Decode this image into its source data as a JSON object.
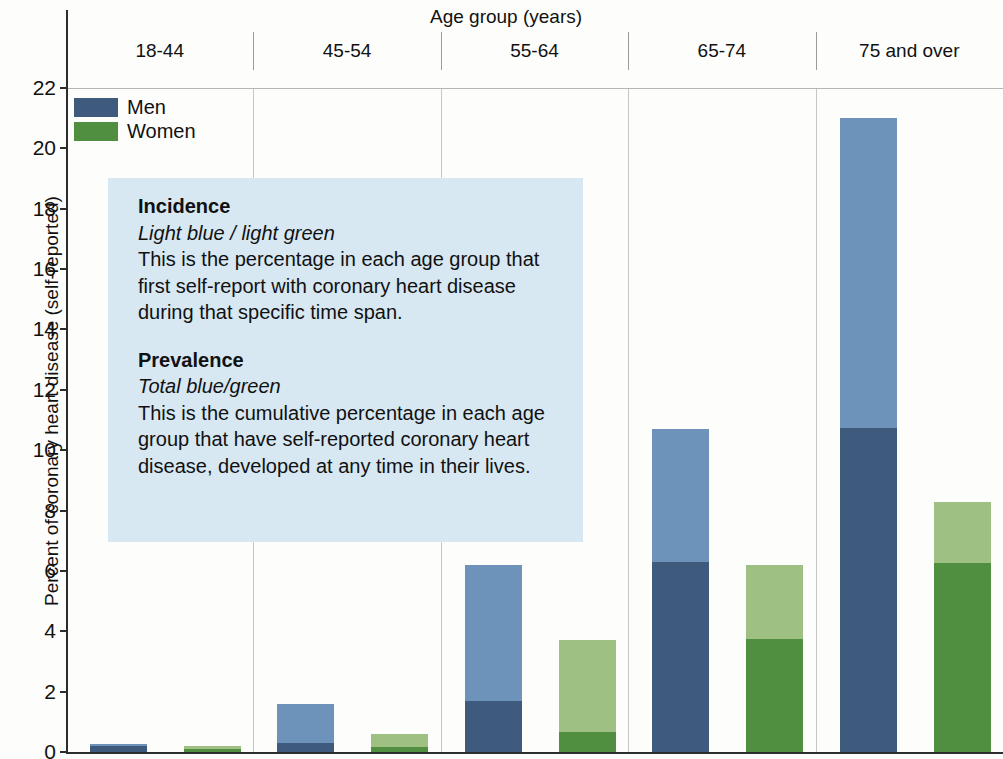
{
  "axes": {
    "x_title": "Age group (years)",
    "y_title": "Percent of coronary heart disease (self-reported)",
    "y_ticks": [
      "22",
      "20",
      "18",
      "16",
      "14",
      "12",
      "10",
      "8",
      "6",
      "4",
      "2",
      "0"
    ]
  },
  "legend": {
    "items": [
      {
        "label": "Men",
        "color": "#3e5b7d"
      },
      {
        "label": "Women",
        "color": "#4f8f3f"
      }
    ]
  },
  "infobox": {
    "incidence_head": "Incidence",
    "incidence_sub": "Light blue / light green",
    "incidence_body": "This is the percentage in each age group that first self-report with coronary heart disease during that specific time span.",
    "prevalence_head": "Prevalence",
    "prevalence_sub": "Total blue/green",
    "prevalence_body": "This is the cumulative percentage in each age group that have self-reported coronary heart disease, developed at any time in their lives.",
    "bg_color": "#d7e8f3"
  },
  "chart_data": {
    "type": "bar",
    "subtype": "grouped-stacked",
    "title": "",
    "xlabel": "Age group (years)",
    "ylabel": "Percent of coronary heart disease (self-reported)",
    "ylim": [
      0,
      22
    ],
    "ytick_step": 2,
    "grid": false,
    "legend_position": "top-left",
    "categories": [
      "18-44",
      "45-54",
      "55-64",
      "65-74",
      "75 and over"
    ],
    "series": [
      {
        "name": "Men",
        "stack_parts": [
          "Prevalence (existing)",
          "Incidence (new)"
        ],
        "colors": {
          "base": "#3e5b7d",
          "incidence": "#6d93bb"
        },
        "base_values": [
          0.2,
          0.3,
          1.7,
          6.3,
          10.75
        ],
        "incidence_values": [
          0.05,
          1.3,
          4.5,
          4.4,
          10.25
        ],
        "total_values": [
          0.25,
          1.6,
          6.2,
          10.7,
          21.0
        ]
      },
      {
        "name": "Women",
        "stack_parts": [
          "Prevalence (existing)",
          "Incidence (new)"
        ],
        "colors": {
          "base": "#4f8f3f",
          "incidence": "#9ec183"
        },
        "base_values": [
          0.1,
          0.15,
          0.65,
          3.75,
          6.25
        ],
        "incidence_values": [
          0.1,
          0.45,
          3.05,
          2.45,
          2.05
        ],
        "total_values": [
          0.2,
          0.6,
          3.7,
          6.2,
          8.3
        ]
      }
    ]
  }
}
